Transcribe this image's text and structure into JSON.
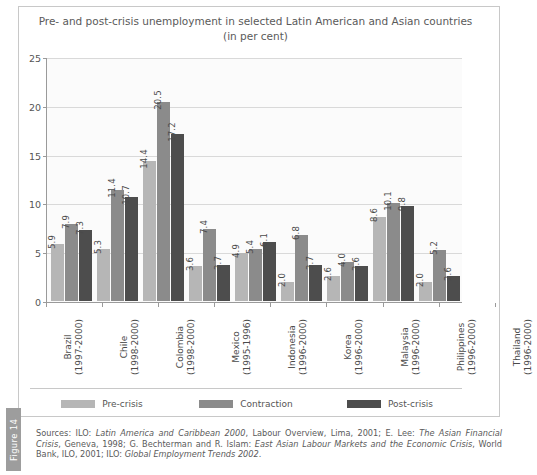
{
  "figure": {
    "tab_label": "Figure 14"
  },
  "chart_data": {
    "type": "bar",
    "title": "Pre- and post-crisis unemployment in selected Latin American and Asian countries",
    "subtitle": "(in per cent)",
    "xlabel": "",
    "ylabel": "",
    "ylim": [
      0,
      25
    ],
    "yticks": [
      "0",
      "5",
      "10",
      "15",
      "20",
      "25"
    ],
    "grid": true,
    "legend_position": "bottom",
    "categories": [
      "Brazil",
      "Chile",
      "Colombia",
      "Mexico",
      "Indonesia",
      "Korea",
      "Malaysia",
      "Philippines",
      "Thailand"
    ],
    "category_periods": [
      "(1997-2000)",
      "(1998-2000)",
      "(1998-2000)",
      "(1995-1996)",
      "(1996-2000)",
      "(1996-2000)",
      "(1996-2000)",
      "(1996-2000)",
      "(1996-2000)"
    ],
    "series": [
      {
        "name": "Pre-crisis",
        "color": "#b6b6b6",
        "values": [
          5.9,
          5.3,
          14.4,
          3.6,
          4.9,
          2.0,
          2.6,
          8.6,
          2.0
        ]
      },
      {
        "name": "Contraction",
        "color": "#8b8b8b",
        "values": [
          7.9,
          11.4,
          20.5,
          7.4,
          5.4,
          6.8,
          4.0,
          10.1,
          5.2
        ]
      },
      {
        "name": "Post-crisis",
        "color": "#4d4d4d",
        "values": [
          7.3,
          10.7,
          17.2,
          3.7,
          6.1,
          3.7,
          3.6,
          9.8,
          2.6
        ]
      }
    ]
  },
  "sources": {
    "prefix": "Sources: ILO: ",
    "t1": "Latin America and Caribbean 2000",
    "s1": ", Labour Overview, Lima, 2001; E. Lee: ",
    "t2": "The Asian Financial Crisis",
    "s2": ", Geneva, 1998; G. Bechterman and R. Islam: ",
    "t3": "East Asian Labour Markets and the Economic Crisis",
    "s3": ", World Bank, ILO, 2001; ILO: ",
    "t4": "Global Employment Trends 2002",
    "s4": "."
  }
}
